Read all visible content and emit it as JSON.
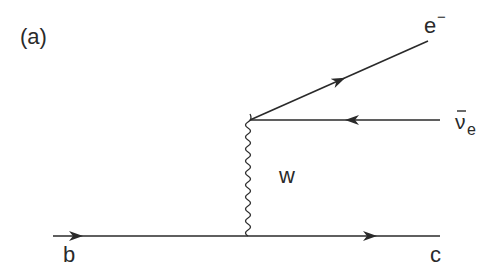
{
  "diagram": {
    "type": "feynman",
    "panel_label": "(a)",
    "colors": {
      "line": "#2a2a2a",
      "background": "#ffffff"
    },
    "particles": {
      "incoming_quark": "b",
      "outgoing_quark": "c",
      "boson": "w",
      "electron": "e",
      "electron_charge": "−",
      "antineutrino": "ν",
      "antineutrino_subscript": "e"
    },
    "edges": [
      {
        "id": "b-line",
        "from": "b",
        "to": "vertex-bottom",
        "style": "fermion",
        "arrow": "forward"
      },
      {
        "id": "c-line",
        "from": "vertex-bottom",
        "to": "c",
        "style": "fermion",
        "arrow": "forward"
      },
      {
        "id": "w-line",
        "from": "vertex-bottom",
        "to": "vertex-top",
        "style": "boson-wavy"
      },
      {
        "id": "e-line",
        "from": "vertex-top",
        "to": "e-",
        "style": "fermion",
        "arrow": "forward"
      },
      {
        "id": "nu-line",
        "from": "anti-nu-e",
        "to": "vertex-top",
        "style": "fermion",
        "arrow": "backward"
      }
    ]
  }
}
